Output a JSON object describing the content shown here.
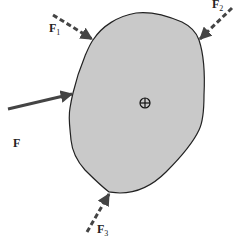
{
  "diagram": {
    "type": "free-body force diagram",
    "body": {
      "fill": "#c8c8c8",
      "stroke": "#222222",
      "center_marker": "center-of-mass-symbol"
    },
    "forces": [
      {
        "id": "F",
        "label": "F",
        "subscript": "",
        "style": "solid",
        "color": "#444444"
      },
      {
        "id": "F1",
        "label": "F",
        "subscript": "1",
        "style": "dashed",
        "color": "#444444"
      },
      {
        "id": "F2",
        "label": "F",
        "subscript": "2",
        "style": "dashed",
        "color": "#444444"
      },
      {
        "id": "F3",
        "label": "F",
        "subscript": "3",
        "style": "dashed",
        "color": "#444444"
      }
    ]
  }
}
